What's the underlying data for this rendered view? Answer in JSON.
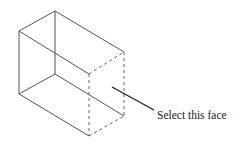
{
  "diagram": {
    "type": "isometric-box-wireframe",
    "annotation": {
      "label": "Select this face",
      "target": "right-front face (dashed edges)"
    },
    "colors": {
      "edges": "#555555",
      "hidden_edges": "#666666",
      "leader": "#222222",
      "text": "#222222",
      "background": "#ffffff"
    }
  }
}
